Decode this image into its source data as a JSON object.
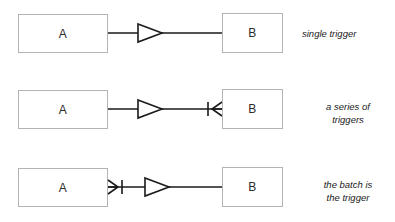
{
  "diagram": {
    "rows": [
      {
        "id": "row-single-trigger",
        "source_label": "A",
        "target_label": "B",
        "caption": "single trigger",
        "source_marker": "none",
        "arrow_marker": "hollow-triangle",
        "target_marker": "none"
      },
      {
        "id": "row-series-of-triggers",
        "source_label": "A",
        "target_label": "B",
        "caption": "a series of\ntriggers",
        "source_marker": "none",
        "arrow_marker": "hollow-triangle",
        "target_marker": "bar-crowsfoot"
      },
      {
        "id": "row-batch-is-trigger",
        "source_label": "A",
        "target_label": "B",
        "caption": "the batch is\nthe  trigger",
        "source_marker": "crowsfoot-bar",
        "arrow_marker": "hollow-triangle",
        "target_marker": "none"
      }
    ],
    "colors": {
      "background": "#ffffff",
      "box_border": "#b3b3b3",
      "line": "#1a1a1a",
      "text": "#1a1a1a"
    }
  }
}
